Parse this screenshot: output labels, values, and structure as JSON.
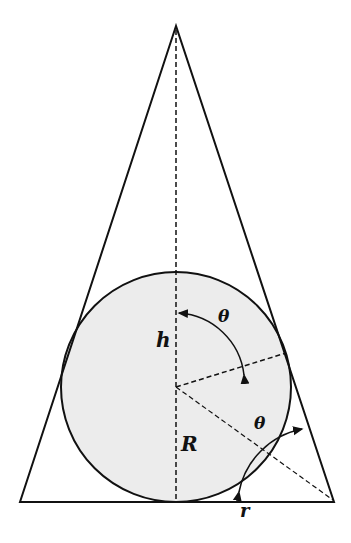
{
  "diagram": {
    "labels": {
      "height": "h",
      "radius_big": "R",
      "radius_small": "r",
      "angle_top": "θ",
      "angle_bottom": "θ"
    },
    "colors": {
      "stroke": "#111111",
      "circle_fill": "#e9e9e9",
      "background": "#ffffff"
    }
  }
}
